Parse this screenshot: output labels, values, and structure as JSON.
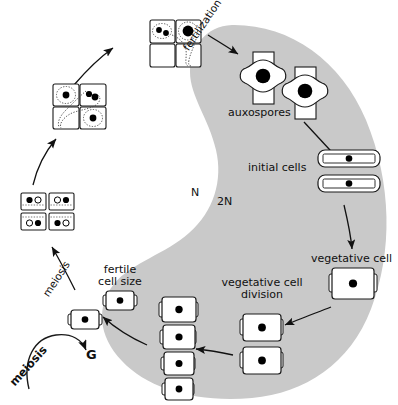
{
  "diagram": {
    "ploidy_labels": {
      "haploid": "N",
      "diploid": "2N"
    },
    "colors": {
      "diploid_region_fill": "#c9c9c9",
      "haploid_region_fill": "#ffffff",
      "cell_outline": "#1a1a1a",
      "nucleus_fill": "#000000",
      "text": "#101010"
    },
    "labels": {
      "fertilization": "fertilization",
      "auxospores": "auxospores",
      "initial_cells": "initial cells",
      "vegetative_cell": "vegetative cell",
      "vegetative_cell_division": "vegetative cell\ndivision",
      "fertile_cell_size": "fertile\ncell size",
      "meiosis_arrow": "meiosis",
      "meiosis_cycle": "meiosis",
      "gamete_stage": "G",
      "meiosis_cycle_start": "M"
    },
    "stages": [
      {
        "name": "auxospores",
        "count": 2,
        "nucleus": "single-large",
        "region": "2N"
      },
      {
        "name": "initial-cells",
        "count": 2,
        "nucleus": "single",
        "region": "2N"
      },
      {
        "name": "vegetative-cell",
        "count": 1,
        "nucleus": "single",
        "region": "2N"
      },
      {
        "name": "vegetative-cell-division",
        "count": 2,
        "nucleus": "single",
        "region": "2N"
      },
      {
        "name": "size-reduction-series",
        "count": 4,
        "nucleus": "single",
        "region": "2N"
      },
      {
        "name": "fertile-cell-size",
        "count": 2,
        "nucleus": "single",
        "region": "2N"
      },
      {
        "name": "gametangia-four-cells",
        "count": 4,
        "nucleus": "two-per-cell",
        "region": "N"
      },
      {
        "name": "gametes-four-cells",
        "count": 4,
        "nucleus": "paired-amoeboid",
        "region": "N"
      },
      {
        "name": "fusing-gametes",
        "count": 2,
        "nucleus": "fusion",
        "region": "N"
      }
    ]
  }
}
